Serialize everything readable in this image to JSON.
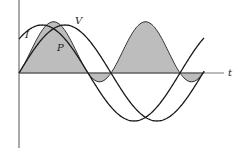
{
  "diagram": {
    "labels": {
      "voltage": "V",
      "current": "I",
      "power": "P",
      "time_axis": "t"
    },
    "colors": {
      "curve": "#1a1a1a",
      "axis": "#555555",
      "power_fill": "#bdbdbd"
    }
  }
}
